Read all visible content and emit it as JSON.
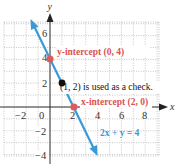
{
  "chart_data": {
    "type": "line",
    "title": "",
    "xlabel": "x",
    "ylabel": "y",
    "xlim": [
      -4,
      9.2
    ],
    "ylim": [
      -4.1,
      7.1
    ],
    "grid": true,
    "grid_step": 1,
    "x_ticks": [
      -2,
      0,
      2,
      4,
      6,
      8
    ],
    "x_tick_labels": [
      "−2",
      "0",
      "2",
      "4",
      "6",
      "8"
    ],
    "y_ticks": [
      -4,
      -2,
      2,
      4,
      6
    ],
    "y_tick_labels": [
      "−4",
      "−2",
      "2",
      "4",
      "6"
    ],
    "series": [
      {
        "name": "2x + y = 4",
        "equation": "2x + y = 4",
        "x": [
          -1.6,
          4
        ],
        "y": [
          7.2,
          -4
        ],
        "color": "#3a9ad9",
        "arrows": "both"
      }
    ],
    "points": [
      {
        "label": "y-intercept (0, 4)",
        "x": 0,
        "y": 4,
        "color": "#e05a5a"
      },
      {
        "label": "x-intercept (2, 0)",
        "x": 2,
        "y": 0,
        "color": "#e05a5a"
      },
      {
        "label": "(1, 2) is used as a check.",
        "x": 1,
        "y": 2,
        "color": "#111111"
      }
    ],
    "annotations": [
      {
        "text": "y-intercept (0, 4)",
        "color": "#d9534f"
      },
      {
        "text": "(1, 2) is used as a check.",
        "color": "#111111"
      },
      {
        "text": "x-intercept (2, 0)",
        "color": "#d9534f"
      },
      {
        "text": "2x + y = 4",
        "color": "#3a9ad9"
      }
    ]
  },
  "labels": {
    "x_axis": "x",
    "y_axis": "y",
    "y_intercept": "y-intercept (0, 4)",
    "check_point": "(1, 2) is used as a check.",
    "x_intercept": "x-intercept (2, 0)",
    "equation": "2x + y = 4",
    "ticks_x": [
      "−2",
      "0",
      "2",
      "4",
      "6",
      "8"
    ],
    "ticks_y": [
      "6",
      "4",
      "2",
      "−2",
      "−4"
    ]
  },
  "colors": {
    "line": "#3a9ad9",
    "intercept": "#e05a5a",
    "check": "#111111",
    "grid": "#b8b8b8",
    "axis": "#333333"
  }
}
